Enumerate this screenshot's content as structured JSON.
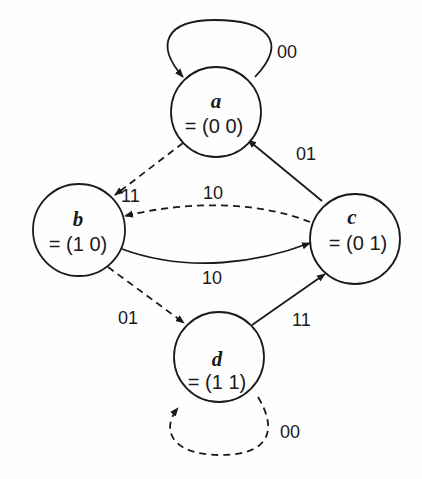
{
  "diagram": {
    "type": "state-transition",
    "colors": {
      "stroke": "#1a1a1a",
      "background": "#fefefe"
    },
    "nodes": [
      {
        "id": "a",
        "name": "a",
        "value": "= (0 0)"
      },
      {
        "id": "b",
        "name": "b",
        "value": "= (1 0)"
      },
      {
        "id": "c",
        "name": "c",
        "value": "= (0 1)"
      },
      {
        "id": "d",
        "name": "d",
        "value": "= (1 1)"
      }
    ],
    "edges": [
      {
        "from": "a",
        "to": "a",
        "label": "00",
        "style": "solid"
      },
      {
        "from": "a",
        "to": "b",
        "label": "11",
        "style": "dashed"
      },
      {
        "from": "c",
        "to": "a",
        "label": "01",
        "style": "solid"
      },
      {
        "from": "c",
        "to": "b",
        "label": "10",
        "style": "dashed"
      },
      {
        "from": "b",
        "to": "c",
        "label": "10",
        "style": "solid"
      },
      {
        "from": "b",
        "to": "d",
        "label": "01",
        "style": "dashed"
      },
      {
        "from": "d",
        "to": "c",
        "label": "11",
        "style": "solid"
      },
      {
        "from": "d",
        "to": "d",
        "label": "00",
        "style": "dashed"
      }
    ]
  }
}
